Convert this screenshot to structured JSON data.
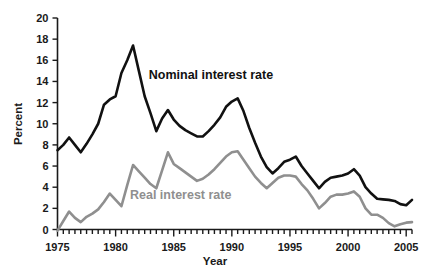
{
  "chart_data": {
    "type": "line",
    "title": "",
    "xlabel": "Year",
    "ylabel": "Percent",
    "xlim": [
      1975,
      2005.5
    ],
    "ylim": [
      0,
      20
    ],
    "grid": false,
    "legend_position": "inline-annotations",
    "y_ticks": [
      0,
      2,
      4,
      6,
      8,
      10,
      12,
      14,
      16,
      18,
      20
    ],
    "y_tick_labels": [
      "0",
      "2",
      "4",
      "6",
      "8",
      "10",
      "12",
      "14",
      "16",
      "18",
      "20"
    ],
    "x_ticks": [
      1975,
      1980,
      1985,
      1990,
      1995,
      2000,
      2005
    ],
    "x_tick_labels": [
      "1975",
      "1980",
      "1985",
      "1990",
      "1995",
      "2000",
      "2005"
    ],
    "x_minor_tick_step": 0.5,
    "x": [
      1975.0,
      1975.5,
      1976.0,
      1976.5,
      1977.0,
      1977.5,
      1978.0,
      1978.5,
      1979.0,
      1979.5,
      1980.0,
      1980.5,
      1981.0,
      1981.5,
      1982.0,
      1982.5,
      1983.0,
      1983.5,
      1984.0,
      1984.5,
      1985.0,
      1985.5,
      1986.0,
      1986.5,
      1987.0,
      1987.5,
      1988.0,
      1988.5,
      1989.0,
      1989.5,
      1990.0,
      1990.5,
      1991.0,
      1991.5,
      1992.0,
      1992.5,
      1993.0,
      1993.5,
      1994.0,
      1994.5,
      1995.0,
      1995.5,
      1996.0,
      1996.5,
      1997.0,
      1997.5,
      1998.0,
      1998.5,
      1999.0,
      1999.5,
      2000.0,
      2000.5,
      2001.0,
      2001.5,
      2002.0,
      2002.5,
      2003.0,
      2003.5,
      2004.0,
      2004.5,
      2005.0,
      2005.5
    ],
    "series": [
      {
        "name": "Nominal interest rate",
        "color": "#111111",
        "stroke_width": 2.6,
        "label_x": 1988.2,
        "label_y": 14.2,
        "values": [
          7.5,
          8.0,
          8.7,
          8.0,
          7.3,
          8.1,
          9.0,
          10.0,
          11.8,
          12.3,
          12.6,
          14.8,
          16.0,
          17.4,
          15.0,
          12.6,
          11.0,
          9.3,
          10.5,
          11.3,
          10.4,
          9.8,
          9.4,
          9.1,
          8.8,
          8.8,
          9.3,
          9.9,
          10.6,
          11.6,
          12.1,
          12.4,
          11.2,
          9.6,
          8.2,
          6.9,
          5.9,
          5.3,
          5.8,
          6.4,
          6.6,
          6.9,
          6.0,
          5.3,
          4.6,
          3.9,
          4.5,
          4.9,
          5.0,
          5.1,
          5.3,
          5.7,
          5.1,
          4.0,
          3.4,
          2.9,
          2.85,
          2.8,
          2.7,
          2.4,
          2.3,
          2.8
        ]
      },
      {
        "name": "Real interest rate",
        "color": "#8f8f8f",
        "stroke_width": 2.6,
        "label_x": 1985.6,
        "label_y": 2.9,
        "values": [
          -0.1,
          0.8,
          1.7,
          1.1,
          0.7,
          1.2,
          1.5,
          1.9,
          2.6,
          3.4,
          2.8,
          2.2,
          4.2,
          6.1,
          5.5,
          4.9,
          4.3,
          3.9,
          5.6,
          7.3,
          6.2,
          5.8,
          5.4,
          5.0,
          4.6,
          4.8,
          5.2,
          5.7,
          6.3,
          6.9,
          7.3,
          7.4,
          6.6,
          5.8,
          5.0,
          4.4,
          3.9,
          4.4,
          4.9,
          5.1,
          5.1,
          5.0,
          4.3,
          3.7,
          2.9,
          2.0,
          2.5,
          3.1,
          3.3,
          3.3,
          3.4,
          3.6,
          3.1,
          2.0,
          1.4,
          1.4,
          1.1,
          0.6,
          0.3,
          0.5,
          0.65,
          0.7
        ]
      }
    ]
  },
  "axis_labels": {
    "y_title": "Percent",
    "x_title": "Year"
  },
  "annotations": {
    "nominal_label": "Nominal interest rate",
    "real_label": "Real interest rate"
  },
  "colors": {
    "nominal": "#111111",
    "real": "#8f8f8f",
    "axis": "#1a1a1a",
    "background": "#ffffff"
  }
}
